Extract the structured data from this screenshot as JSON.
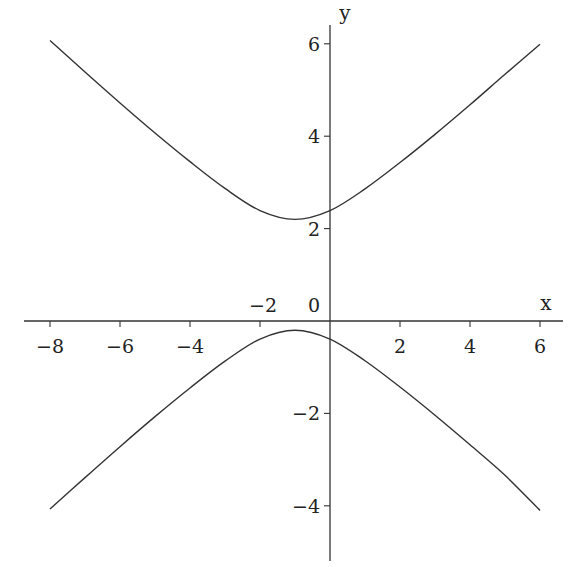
{
  "chart_data": {
    "type": "line",
    "title": "",
    "xlabel": "x",
    "ylabel": "y",
    "xlim": [
      -8.2,
      6.7
    ],
    "ylim": [
      -5.2,
      6.4
    ],
    "grid": false,
    "legend": null,
    "x_ticks": [
      -8,
      -6,
      -4,
      -2,
      0,
      2,
      4,
      6
    ],
    "x_tick_labels": [
      "−8",
      "−6",
      "−4",
      "−2",
      "0",
      "2",
      "4",
      "6"
    ],
    "y_ticks": [
      6,
      4,
      2,
      -2,
      -4
    ],
    "y_tick_labels": [
      "6",
      "4",
      "2",
      "−2",
      "−4"
    ],
    "series": [
      {
        "name": "upper branch",
        "x": [
          -8,
          -7,
          -6,
          -5,
          -4,
          -3,
          -2,
          -1,
          0,
          1,
          2,
          3,
          4,
          5,
          6
        ],
        "y": [
          6.07,
          5.39,
          4.72,
          4.07,
          3.45,
          2.87,
          2.39,
          2.2,
          2.39,
          2.86,
          3.43,
          4.04,
          4.68,
          5.34,
          5.99
        ]
      },
      {
        "name": "lower branch",
        "x": [
          -8,
          -7,
          -6,
          -5,
          -4,
          -3,
          -2,
          -1,
          0,
          1,
          2,
          3,
          4,
          5,
          6
        ],
        "y": [
          -4.07,
          -3.39,
          -2.72,
          -2.07,
          -1.45,
          -0.87,
          -0.39,
          -0.2,
          -0.39,
          -0.86,
          -1.43,
          -2.04,
          -2.68,
          -3.34,
          -4.1
        ]
      }
    ],
    "line_color": "#333333",
    "axis_color": "#333333"
  }
}
